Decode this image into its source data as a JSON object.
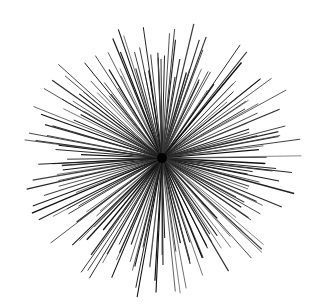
{
  "figure": {
    "background": "#ffffff",
    "stroke_color": "#1a1a1a",
    "center": [
      162,
      158
    ],
    "ray_count": 200,
    "min_radius": 80,
    "max_radius": 145,
    "x_scale": 1.0,
    "y_scale": 1.0,
    "seed": 7
  }
}
